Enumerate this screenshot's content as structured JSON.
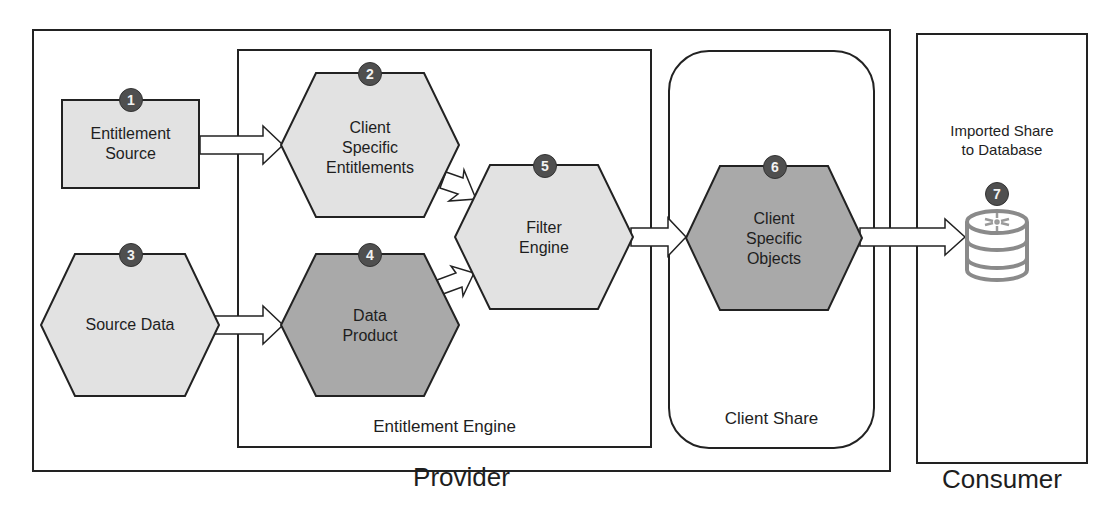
{
  "diagram": {
    "containers": {
      "provider": {
        "label": "Provider"
      },
      "consumer": {
        "label": "Consumer"
      },
      "entitlement_engine": {
        "label": "Entitlement Engine"
      },
      "client_share": {
        "label": "Client Share"
      }
    },
    "nodes": [
      {
        "id": "1",
        "badge": "1",
        "shape": "rectangle",
        "line1": "Entitlement",
        "line2": "Source",
        "line3": "",
        "fill": "#e2e2e2"
      },
      {
        "id": "2",
        "badge": "2",
        "shape": "hexagon",
        "line1": "Client",
        "line2": "Specific",
        "line3": "Entitlements",
        "fill": "#e2e2e2"
      },
      {
        "id": "3",
        "badge": "3",
        "shape": "hexagon",
        "line1": "Source Data",
        "line2": "",
        "line3": "",
        "fill": "#e2e2e2"
      },
      {
        "id": "4",
        "badge": "4",
        "shape": "hexagon",
        "line1": "Data",
        "line2": "Product",
        "line3": "",
        "fill": "#a9a9a9"
      },
      {
        "id": "5",
        "badge": "5",
        "shape": "hexagon",
        "line1": "Filter",
        "line2": "Engine",
        "line3": "",
        "fill": "#e2e2e2"
      },
      {
        "id": "6",
        "badge": "6",
        "shape": "hexagon",
        "line1": "Client",
        "line2": "Specific",
        "line3": "Objects",
        "fill": "#a9a9a9"
      },
      {
        "id": "7",
        "badge": "7",
        "shape": "database",
        "line1": "Imported Share",
        "line2": "to Database",
        "line3": "",
        "icon": "snowflake-database-icon"
      }
    ],
    "edges": [
      {
        "from": "1",
        "to": "2"
      },
      {
        "from": "3",
        "to": "4"
      },
      {
        "from": "2",
        "to": "5"
      },
      {
        "from": "4",
        "to": "5"
      },
      {
        "from": "5",
        "to": "6"
      },
      {
        "from": "6",
        "to": "7"
      }
    ],
    "colors": {
      "light_fill": "#e2e2e2",
      "dark_fill": "#a9a9a9",
      "stroke": "#222222",
      "badge": "#4f4f4f",
      "db_icon": "#8a8a8a"
    }
  }
}
